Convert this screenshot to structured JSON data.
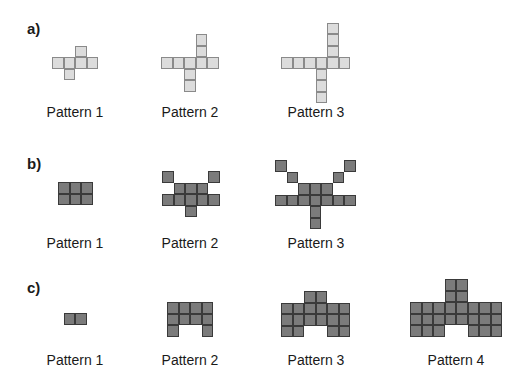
{
  "sections": [
    {
      "label": "a)",
      "style": "light",
      "patterns": [
        {
          "caption": "Pattern 1",
          "x": 52,
          "y": 45,
          "cells": [
            [
              1,
              0
            ],
            [
              0,
              1
            ],
            [
              1,
              1
            ],
            [
              2,
              1
            ],
            [
              3,
              1
            ],
            [
              1,
              2
            ]
          ],
          "note": "row of 4, one up at col 2, one down at col 1"
        },
        {
          "caption": "Pattern 2",
          "x": 161,
          "y": 34,
          "cells": [],
          "note": "row of 5, two up at col 3, two down at col 2"
        },
        {
          "caption": "Pattern 3",
          "x": 281,
          "y": 22,
          "cells": [],
          "note": "row of 6, three up at col 4, three down at col 3"
        }
      ]
    },
    {
      "label": "b)",
      "style": "dark",
      "patterns": [
        {
          "caption": "Pattern 1"
        },
        {
          "caption": "Pattern 2"
        },
        {
          "caption": "Pattern 3"
        }
      ]
    },
    {
      "label": "c)",
      "style": "dark",
      "patterns": [
        {
          "caption": "Pattern 1"
        },
        {
          "caption": "Pattern 2"
        },
        {
          "caption": "Pattern 3"
        },
        {
          "caption": "Pattern 4"
        }
      ]
    }
  ],
  "layout": {
    "cell_size": 11.5,
    "colors": {
      "light_fill": "#dcdcdc",
      "light_border": "#8a8a8a",
      "dark_fill": "#7b7b7b",
      "dark_border": "#3a3a3a"
    }
  },
  "patterns_geom": {
    "a1": {
      "x": 52,
      "y": 45.5,
      "rows": [
        "..X.",
        "XXXX",
        ".X.."
      ]
    },
    "a2": {
      "x": 161,
      "y": 34,
      "rows": [
        "...X.",
        "...X.",
        "XXXXX",
        "..X..",
        "..X.."
      ]
    },
    "a3": {
      "x": 281,
      "y": 22.5,
      "rows": [
        "....X.",
        "....X.",
        "....X.",
        "XXXXXX",
        "...X..",
        "...X..",
        "...X.."
      ]
    },
    "b1": {
      "x": 58,
      "y": 182,
      "rows": [
        "XXX",
        "XXX"
      ]
    },
    "b2": {
      "x": 162,
      "y": 171,
      "rows": [
        "X...X",
        ".XXX.",
        "XXXXX",
        "..X.."
      ]
    },
    "b3": {
      "x": 275,
      "y": 160,
      "rows": [
        "X.....X",
        ".X...X.",
        "..XXX..",
        "XXXXXXX",
        "...X...",
        "...X..."
      ]
    },
    "c1": {
      "x": 63.5,
      "y": 313,
      "rows": [
        "XX"
      ]
    },
    "c2": {
      "x": 167,
      "y": 302,
      "rows": [
        "XXXX",
        "XXXX",
        "X..X"
      ]
    },
    "c3": {
      "x": 281,
      "y": 291,
      "rows": [
        "..XX..",
        "XXXXXX",
        "XXXXXX",
        "XX..XX"
      ]
    },
    "c4": {
      "x": 410,
      "y": 279,
      "rows": [
        "...XX...",
        "...XX...",
        "XXXXXXXX",
        "XXXXXXXX",
        "XXX..XXX"
      ]
    }
  }
}
